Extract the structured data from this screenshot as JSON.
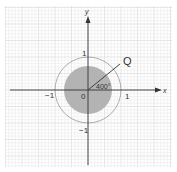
{
  "diagram": {
    "type": "unit-circle-rotation",
    "axes": {
      "x_label": "x",
      "y_label": "y"
    },
    "ticks": {
      "x_pos": "1",
      "x_neg": "−1",
      "y_pos": "1",
      "y_neg": "−1",
      "origin": "0"
    },
    "point_label": "Q",
    "angle_label": "400°",
    "colors": {
      "grid_minor": "#e6e6e6",
      "grid_major": "#cfcfcf",
      "axis": "#333333",
      "outer_circle": "#999999",
      "disk_fill": "#b3b3b3",
      "ray": "#333333"
    }
  }
}
